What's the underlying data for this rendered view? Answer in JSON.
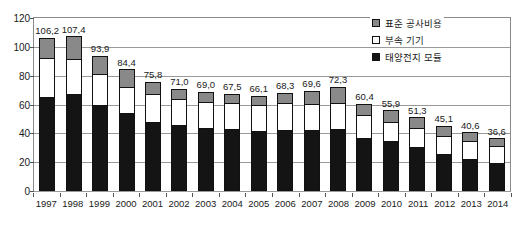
{
  "chart_data": {
    "type": "bar",
    "stacked": true,
    "title": "",
    "subtitle": "",
    "xlabel": "",
    "ylabel": "",
    "ylim": [
      0,
      120
    ],
    "yticks": [
      0,
      20,
      40,
      60,
      80,
      100,
      120
    ],
    "grid": true,
    "legend_position": "top-right",
    "categories": [
      "1997",
      "1998",
      "1999",
      "2000",
      "2001",
      "2002",
      "2003",
      "2004",
      "2005",
      "2006",
      "2007",
      "2008",
      "2009",
      "2010",
      "2011",
      "2012",
      "2013",
      "2014"
    ],
    "series": [
      {
        "name": "태양전지 모듈",
        "color": "#141414",
        "values": [
          65.0,
          67.0,
          60.0,
          54.0,
          48.0,
          45.5,
          44.0,
          43.0,
          41.5,
          42.0,
          42.0,
          43.0,
          37.0,
          34.5,
          30.5,
          25.5,
          22.5,
          19.5
        ]
      },
      {
        "name": "부속 기기",
        "color": "#ffffff",
        "values": [
          27.0,
          24.5,
          21.0,
          18.0,
          19.0,
          18.0,
          18.0,
          18.0,
          18.5,
          19.0,
          18.5,
          18.0,
          16.0,
          13.5,
          13.0,
          12.5,
          12.0,
          11.5
        ]
      },
      {
        "name": "표준 공사비용",
        "color": "#898989",
        "values": [
          14.2,
          15.9,
          12.9,
          12.4,
          8.8,
          7.5,
          7.0,
          6.5,
          6.1,
          7.3,
          9.1,
          11.3,
          7.4,
          7.9,
          7.8,
          7.1,
          6.1,
          5.6
        ]
      }
    ],
    "totals": [
      106.2,
      107.4,
      93.9,
      84.4,
      75.8,
      71.0,
      69.0,
      67.5,
      66.1,
      68.3,
      69.6,
      72.3,
      60.4,
      55.9,
      51.3,
      45.1,
      40.6,
      36.6
    ],
    "total_labels": [
      "106,2",
      "107,4",
      "93,9",
      "84,4",
      "75,8",
      "71,0",
      "69,0",
      "67,5",
      "66,1",
      "68,3",
      "69,6",
      "72,3",
      "60,4",
      "55,9",
      "51,3",
      "45,1",
      "40,6",
      "36,6"
    ],
    "ytick_labels": [
      "0",
      "20",
      "40",
      "60",
      "80",
      "100",
      "120"
    ]
  },
  "legend": {
    "items": [
      {
        "label": "표준 공사비용",
        "swatch": "gray-square-icon"
      },
      {
        "label": "부속 기기",
        "swatch": "white-square-icon"
      },
      {
        "label": "태양전지 모듈",
        "swatch": "black-square-icon"
      }
    ]
  }
}
